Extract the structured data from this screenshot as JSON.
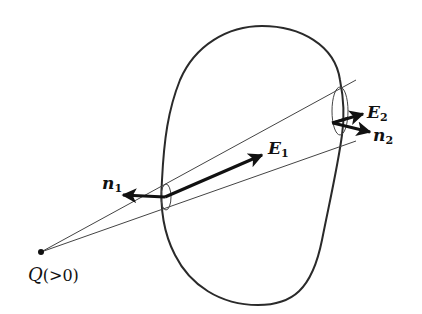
{
  "diagram": {
    "charge": {
      "symbol": "Q",
      "condition": "(>0)",
      "x": 41,
      "y": 252
    },
    "labels": {
      "n1": {
        "base": "n",
        "sub": "1"
      },
      "E1": {
        "base": "E",
        "sub": "1"
      },
      "E2": {
        "base": "E",
        "sub": "2"
      },
      "n2": {
        "base": "n",
        "sub": "2"
      }
    },
    "colors": {
      "stroke": "#222222",
      "thin": "#444444",
      "background": "#ffffff"
    }
  }
}
